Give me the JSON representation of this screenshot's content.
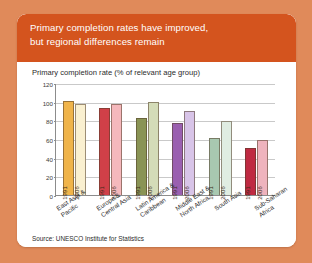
{
  "header": {
    "line1": "Primary completion rates have improved,",
    "line2": "but regional differences remain",
    "background_color": "#d4541e",
    "text_color": "#ffffff"
  },
  "page": {
    "background_color": "#e08a5a",
    "card_color": "#ffffff"
  },
  "source": "Source: UNESCO Institute for Statistics",
  "chart_data": {
    "type": "bar",
    "title": "Primary completion rate (% of relevant age group)",
    "xlabel": "",
    "ylabel": "",
    "ylim": [
      0,
      120
    ],
    "yticks": [
      0,
      20,
      40,
      60,
      80,
      100,
      120
    ],
    "ytick_labels": [
      "0",
      "20",
      "40",
      "60",
      "80",
      "100",
      "120"
    ],
    "grid": true,
    "legend": "in-bar",
    "categories": [
      "East Asia & Pacific",
      "Europe & Central Asia",
      "Latin America & Caribbean",
      "Middle East & North Africa",
      "South Asia",
      "Sub-Saharan Africa"
    ],
    "category_lines": [
      [
        "East Asia &",
        "Pacific"
      ],
      [
        "Europe &",
        "Central Asia"
      ],
      [
        "Latin America &",
        "Caribbean"
      ],
      [
        "Middle East &",
        "North Africa"
      ],
      [
        "South Asia"
      ],
      [
        "Sub-Saharan",
        "Africa"
      ]
    ],
    "series": [
      {
        "name": "1991",
        "values": [
          101,
          93,
          82,
          77,
          61,
          50
        ]
      },
      {
        "name": "2006",
        "values": [
          98,
          98,
          100,
          90,
          79,
          59
        ]
      }
    ],
    "colors": {
      "east_asia_1991": "#f0b44a",
      "east_asia_2006": "#faf0d0",
      "europe_1991": "#d04048",
      "europe_2006": "#f5b8bc",
      "latin_america_1991": "#8a9455",
      "latin_america_2006": "#d4dcb8",
      "middle_east_1991": "#9a5fb0",
      "middle_east_2006": "#d8c4e8",
      "south_asia_1991": "#a8c8b0",
      "south_asia_2006": "#e0ede2",
      "africa_1991": "#bf2a42",
      "africa_2006": "#efb3bd"
    }
  }
}
